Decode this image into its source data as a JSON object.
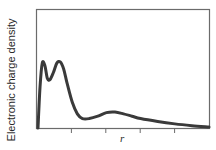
{
  "chart_data": {
    "type": "line",
    "title": "",
    "xlabel": "r",
    "ylabel": "Electronic charge density",
    "x_tick_count": 4,
    "x_tick_labels": [],
    "y_tick_labels": [],
    "grid": false,
    "legend": null,
    "units": "relative (no numeric axis labels shown)",
    "xlim": [
      0,
      1
    ],
    "ylim": [
      0,
      1
    ],
    "series": [
      {
        "name": "radial charge density",
        "color": "#3a3a3a",
        "x": [
          0.0,
          0.012,
          0.025,
          0.04,
          0.055,
          0.07,
          0.09,
          0.11,
          0.13,
          0.15,
          0.17,
          0.2,
          0.23,
          0.26,
          0.3,
          0.35,
          0.4,
          0.45,
          0.5,
          0.55,
          0.6,
          0.7,
          0.8,
          0.9,
          1.0
        ],
        "values": [
          0.0,
          0.35,
          0.55,
          0.53,
          0.42,
          0.41,
          0.47,
          0.55,
          0.56,
          0.5,
          0.38,
          0.22,
          0.12,
          0.08,
          0.08,
          0.1,
          0.13,
          0.135,
          0.12,
          0.1,
          0.08,
          0.055,
          0.035,
          0.02,
          0.008
        ]
      }
    ],
    "features": [
      {
        "label": "first peak",
        "x": 0.03,
        "y": 0.55
      },
      {
        "label": "local minimum",
        "x": 0.06,
        "y": 0.41
      },
      {
        "label": "second peak",
        "x": 0.12,
        "y": 0.56
      },
      {
        "label": "trough",
        "x": 0.28,
        "y": 0.08
      },
      {
        "label": "broad third maximum",
        "x": 0.44,
        "y": 0.135
      }
    ]
  },
  "axes": {
    "frame_color": "#6b6b6b",
    "curve_color": "#3a3a3a"
  }
}
